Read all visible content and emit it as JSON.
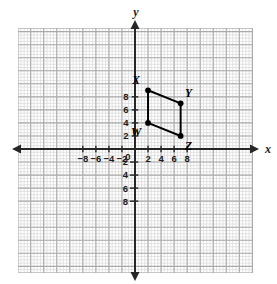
{
  "figure": {
    "background_color": "#ffffff",
    "grid": {
      "minor_color": "#d8d8d8",
      "major_color": "#aaaaaa",
      "minor_step_units": 0.5,
      "major_step_units": 2,
      "x_range": [
        -9,
        9
      ],
      "y_range": [
        -9.5,
        9.5
      ],
      "show": true
    },
    "axes": {
      "color": "#262626",
      "x_label": "x",
      "y_label": "y",
      "origin_label": "0",
      "x_ticks": [
        "-8",
        "-6",
        "-4",
        "-2",
        "0",
        "2",
        "4",
        "6",
        "8"
      ],
      "x_tick_values": [
        -8,
        -6,
        -4,
        -2,
        0,
        2,
        4,
        6,
        8
      ],
      "y_ticks_positive": [
        "8",
        "6",
        "4",
        "2"
      ],
      "y_tick_values_positive": [
        8,
        6,
        4,
        2
      ],
      "y_ticks_negative": [
        "2",
        "4",
        "6",
        "8"
      ],
      "y_tick_values_negative": [
        -2,
        -4,
        -6,
        -8
      ],
      "arrows": [
        "left",
        "right",
        "up",
        "down"
      ]
    }
  },
  "chart_data": {
    "type": "scatter",
    "xlabel": "x",
    "ylabel": "y",
    "xlim": [
      -9,
      9
    ],
    "ylim": [
      -9.5,
      9.5
    ],
    "grid": true,
    "legend": "none",
    "shape": {
      "name": "WXYZ",
      "kind": "parallelogram",
      "stroke_color": "#000000",
      "stroke_width": 2,
      "fill": "none",
      "closed": true,
      "vertex_order": [
        "W",
        "X",
        "Y",
        "Z"
      ]
    },
    "points": [
      {
        "label": "W",
        "x": 2,
        "y": 4,
        "label_dx": -12,
        "label_dy": 13
      },
      {
        "label": "X",
        "x": 2,
        "y": 9,
        "label_dx": -12,
        "label_dy": -6
      },
      {
        "label": "Y",
        "x": 7,
        "y": 7,
        "label_dx": 8,
        "label_dy": -6
      },
      {
        "label": "Z",
        "x": 7,
        "y": 2,
        "label_dx": 8,
        "label_dy": 14
      }
    ],
    "edges": [
      {
        "from": "W",
        "to": "X"
      },
      {
        "from": "X",
        "to": "Y"
      },
      {
        "from": "Y",
        "to": "Z"
      },
      {
        "from": "Z",
        "to": "W"
      }
    ]
  }
}
